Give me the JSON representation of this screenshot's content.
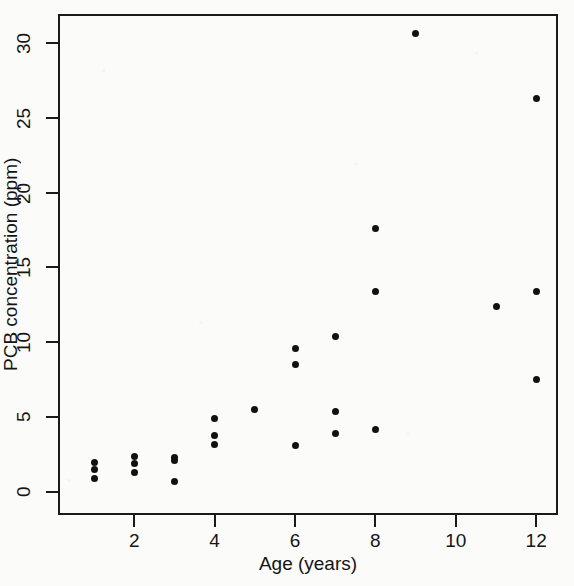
{
  "chart_data": {
    "type": "scatter",
    "title": "",
    "xlabel": "Age (years)",
    "ylabel": "PCB concentration (ppm)",
    "xlim": [
      0.5,
      12.8
    ],
    "ylim": [
      -0.6,
      31.6
    ],
    "xticks": [
      2,
      4,
      6,
      8,
      10,
      12
    ],
    "yticks": [
      0,
      5,
      10,
      15,
      20,
      25,
      30
    ],
    "xtick_labels": [
      "2",
      "4",
      "6",
      "8",
      "10",
      "12"
    ],
    "ytick_labels": [
      "0",
      "5",
      "10",
      "15",
      "20",
      "25",
      "30"
    ],
    "grid": false,
    "legend": false,
    "marker": "filled-circle",
    "marker_color": "#111111",
    "series": [
      {
        "name": "PCB concentration vs age",
        "x": [
          1,
          1,
          1,
          2,
          2,
          2,
          3,
          3,
          3,
          4,
          4,
          4,
          5,
          6,
          6,
          6,
          7,
          7,
          7,
          8,
          8,
          8,
          9,
          11,
          12,
          12,
          12
        ],
        "y": [
          0.9,
          1.5,
          2.0,
          1.3,
          1.9,
          2.4,
          0.7,
          2.1,
          2.3,
          3.2,
          3.8,
          4.9,
          5.5,
          3.1,
          8.5,
          9.6,
          3.9,
          5.4,
          10.4,
          4.2,
          13.4,
          17.6,
          30.6,
          12.4,
          7.5,
          13.4,
          26.3
        ]
      }
    ],
    "points": [
      {
        "x": 1,
        "y": 2.0
      },
      {
        "x": 1,
        "y": 1.5
      },
      {
        "x": 1,
        "y": 0.9
      },
      {
        "x": 2,
        "y": 2.4
      },
      {
        "x": 2,
        "y": 1.9
      },
      {
        "x": 2,
        "y": 1.3
      },
      {
        "x": 3,
        "y": 2.3
      },
      {
        "x": 3,
        "y": 2.1
      },
      {
        "x": 3,
        "y": 0.7
      },
      {
        "x": 4,
        "y": 4.9
      },
      {
        "x": 4,
        "y": 3.8
      },
      {
        "x": 4,
        "y": 3.2
      },
      {
        "x": 5,
        "y": 5.5
      },
      {
        "x": 6,
        "y": 9.6
      },
      {
        "x": 6,
        "y": 8.5
      },
      {
        "x": 6,
        "y": 3.1
      },
      {
        "x": 7,
        "y": 10.4
      },
      {
        "x": 7,
        "y": 5.4
      },
      {
        "x": 7,
        "y": 3.9
      },
      {
        "x": 8,
        "y": 17.6
      },
      {
        "x": 8,
        "y": 13.4
      },
      {
        "x": 8,
        "y": 4.2
      },
      {
        "x": 9,
        "y": 30.6
      },
      {
        "x": 11,
        "y": 12.4
      },
      {
        "x": 12,
        "y": 26.3
      },
      {
        "x": 12,
        "y": 13.4
      },
      {
        "x": 12,
        "y": 7.5
      }
    ]
  },
  "axes": {
    "x_title": "Age (years)",
    "y_title": "PCB concentration (ppm)"
  },
  "colors": {
    "axis": "#1a1a1a",
    "marker": "#111111",
    "background": "#fbfbfa"
  }
}
